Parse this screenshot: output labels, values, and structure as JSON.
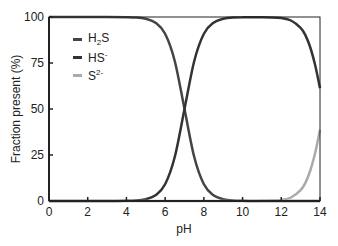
{
  "chart_data": {
    "type": "line",
    "title": "",
    "xlabel": "pH",
    "ylabel": "Fraction present (%)",
    "xlim": [
      0,
      14
    ],
    "ylim": [
      0,
      100
    ],
    "xticks": [
      0,
      2,
      4,
      6,
      8,
      10,
      12,
      14
    ],
    "yticks": [
      0,
      25,
      50,
      75,
      100
    ],
    "grid": false,
    "legend_position": "upper-left inside",
    "x": [
      0,
      1,
      2,
      3,
      4,
      4.5,
      5,
      5.5,
      6,
      6.5,
      7,
      7.5,
      8,
      8.5,
      9,
      9.5,
      10,
      10.5,
      11,
      11.5,
      12,
      12.5,
      13,
      13.25,
      13.5,
      13.75,
      14
    ],
    "series": [
      {
        "name": "H2S",
        "label_base": "H",
        "label_sub": "2",
        "label_rest": "S",
        "label_sup": "",
        "color": "#444444",
        "values": [
          100,
          100,
          100,
          100,
          99.9,
          99.7,
          99.0,
          96.9,
          90.9,
          76.0,
          50.0,
          24.0,
          9.1,
          3.1,
          1.0,
          0.3,
          0.1,
          0,
          0,
          0,
          0,
          0,
          0,
          0,
          0,
          0,
          0
        ]
      },
      {
        "name": "HS-",
        "label_base": "HS",
        "label_sub": "",
        "label_rest": "",
        "label_sup": "-",
        "color": "#333333",
        "values": [
          0,
          0,
          0,
          0,
          0.1,
          0.3,
          1.0,
          3.1,
          9.1,
          24.0,
          50.0,
          76.0,
          90.9,
          96.9,
          99.0,
          99.7,
          99.9,
          99.9,
          99.9,
          99.8,
          99.4,
          98.1,
          94.1,
          90.0,
          83.4,
          73.8,
          61.3
        ]
      },
      {
        "name": "S2-",
        "label_base": "S",
        "label_sub": "",
        "label_rest": "",
        "label_sup": "2-",
        "color": "#aaaaaa",
        "values": [
          0,
          0,
          0,
          0,
          0,
          0,
          0,
          0,
          0,
          0,
          0,
          0,
          0,
          0,
          0,
          0,
          0,
          0,
          0.1,
          0.2,
          0.6,
          1.9,
          5.9,
          10.0,
          16.6,
          26.2,
          38.7
        ]
      }
    ]
  }
}
